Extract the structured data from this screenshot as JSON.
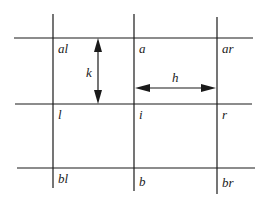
{
  "diagram": {
    "type": "grid-stencil",
    "colors": {
      "line": "#1a1a1a",
      "text": "#222222",
      "background": "#ffffff"
    },
    "nodes": {
      "al": "al",
      "a": "a",
      "ar": "ar",
      "l": "l",
      "i": "i",
      "r": "r",
      "bl": "bl",
      "b": "b",
      "br": "br"
    },
    "dimensions": {
      "vertical_spacing": "k",
      "horizontal_spacing": "h"
    }
  }
}
